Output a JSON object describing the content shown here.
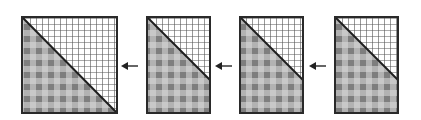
{
  "diagram": {
    "colors": {
      "border": "#2a2a2a",
      "grid_line": "#555555",
      "plaid_light": "#c8c8c8",
      "plaid_mid": "#a6a6a6",
      "plaid_dark": "#7e7e7e",
      "background": "#ffffff"
    },
    "panels": [
      {
        "id": 1,
        "x": 22,
        "y": 17,
        "width": 95,
        "height": 96,
        "diagonal": "top-left to bottom-right"
      },
      {
        "id": 2,
        "x": 147,
        "y": 17,
        "width": 63,
        "height": 96,
        "diagonal": "top-left to mid-right"
      },
      {
        "id": 3,
        "x": 240,
        "y": 17,
        "width": 63,
        "height": 96,
        "diagonal": "top-left to mid-right"
      },
      {
        "id": 4,
        "x": 335,
        "y": 17,
        "width": 63,
        "height": 96,
        "diagonal": "top-left to mid-right"
      }
    ],
    "arrows": [
      {
        "from_panel": 2,
        "to_panel": 1,
        "direction": "left"
      },
      {
        "from_panel": 3,
        "to_panel": 2,
        "direction": "left"
      },
      {
        "from_panel": 4,
        "to_panel": 3,
        "direction": "left"
      }
    ]
  }
}
